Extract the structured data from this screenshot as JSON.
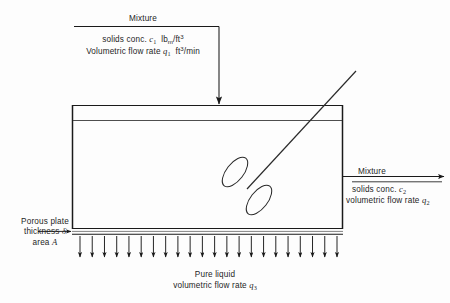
{
  "figure": {
    "kind": "process-flow-diagram",
    "background_color": "#fdfdfd",
    "line_color": "#1a1a1a"
  },
  "inlet": {
    "title": "Mixture",
    "solids_label": "solids conc.",
    "solids_symbol": "c",
    "solids_sub": "1",
    "solids_units_main": "lb",
    "solids_units_sub": "m",
    "solids_units_rest": "/ft",
    "solids_units_sup": "3",
    "flow_label": "Volumetric flow rate",
    "flow_symbol": "q",
    "flow_sub": "1",
    "flow_units_main": "ft",
    "flow_units_sup": "3",
    "flow_units_rest": "/min"
  },
  "outlet": {
    "title": "Mixture",
    "solids_label": "solids conc.",
    "solids_symbol": "c",
    "solids_sub": "2",
    "flow_label": "volumetric flow rate",
    "flow_symbol": "q",
    "flow_sub": "2"
  },
  "porous_plate": {
    "line1": "Porous plate",
    "line2_label": "thickness",
    "line2_symbol": "δ",
    "line3_label": "area",
    "line3_symbol": "A"
  },
  "permeate": {
    "line1": "Pure liquid",
    "line2_label": "volumetric flow rate",
    "line2_symbol": "q",
    "line2_sub": "3"
  },
  "geometry": {
    "tank_left_x": 72,
    "tank_right_x": 343,
    "tank_top_y": 105,
    "tank_bottom_y": 230,
    "liquid_surface_y": 120,
    "plate_top_y": 228,
    "plate_bottom_y": 234,
    "inlet_feed_x": 219,
    "inlet_arrow_tip_y": 111,
    "outlet_y": 176,
    "impeller_center_x": 248,
    "impeller_center_y": 186,
    "shaft_top_x": 356,
    "shaft_top_y": 71,
    "permeate_arrow_count": 22,
    "permeate_arrow_top_y": 236,
    "permeate_arrow_bottom_y": 262
  }
}
